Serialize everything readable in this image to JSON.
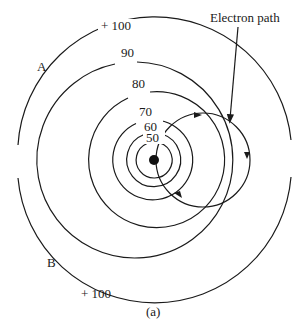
{
  "figure": {
    "caption": "(a)",
    "annotation": "Electron path",
    "region_labels": {
      "a": "A",
      "b": "B"
    },
    "equipotentials": [
      {
        "label": "50",
        "radius": 18
      },
      {
        "label": "60",
        "radius": 27
      },
      {
        "label": "70",
        "radius": 40
      },
      {
        "label": "80",
        "radius": 68
      },
      {
        "label": "90",
        "radius": 98
      }
    ],
    "outer_labels": {
      "top": "+ 100",
      "bottom": "+ 100"
    },
    "colors": {
      "stroke": "#1a1a1a",
      "background": "#ffffff"
    }
  }
}
